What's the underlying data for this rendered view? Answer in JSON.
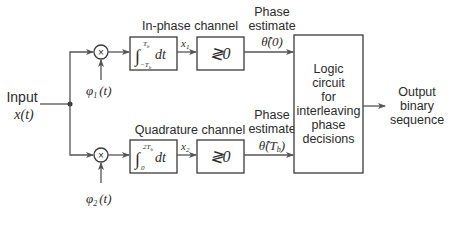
{
  "diagram": {
    "input": {
      "label": "Input",
      "signal": "x(t)"
    },
    "in_phase": {
      "channel_label": "In-phase channel",
      "multiplier_symbol": "×",
      "basis": "φ1(t)",
      "basis_main": "φ",
      "basis_sub": "1",
      "basis_arg": "(t)",
      "integrator": {
        "upper": "Tb",
        "lower": "−Tb",
        "integrand": "dt"
      },
      "integrator_upper_main": "T",
      "integrator_upper_sub": "b",
      "integrator_lower_main": "−T",
      "integrator_lower_sub": "b",
      "output_var_main": "x",
      "output_var_sub": "1",
      "comparator": "≷0",
      "estimate_label_1": "Phase",
      "estimate_label_2": "estimate",
      "estimate_value": "θ̂(0)"
    },
    "quadrature": {
      "channel_label": "Quadrature channel",
      "multiplier_symbol": "×",
      "basis": "φ2(t)",
      "basis_main": "φ",
      "basis_sub": "2",
      "basis_arg": "(t)",
      "integrator": {
        "upper": "2Tb",
        "lower": "0",
        "integrand": "dt"
      },
      "integrator_upper_main": "2T",
      "integrator_upper_sub": "b",
      "integrator_lower_main": "0",
      "output_var_main": "x",
      "output_var_sub": "2",
      "comparator": "≷0",
      "estimate_label_1": "Phase",
      "estimate_label_2": "estimate",
      "estimate_value_main": "θ̂(T",
      "estimate_value_sub": "b",
      "estimate_value_close": ")"
    },
    "logic": {
      "lines": [
        "Logic",
        "circuit",
        "for",
        "interleaving",
        "phase",
        "decisions"
      ]
    },
    "output": {
      "lines": [
        "Output",
        "binary",
        "sequence"
      ]
    },
    "colors": {
      "line": "#555555",
      "text": "#2a2a2a",
      "box": "#3a3a3a"
    }
  }
}
